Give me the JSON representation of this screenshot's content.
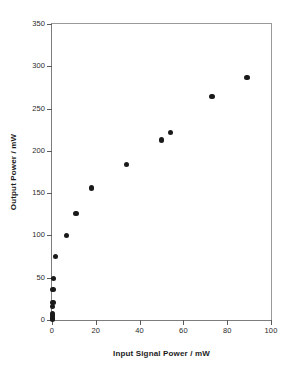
{
  "chart_data": {
    "type": "scatter",
    "title": "",
    "xlabel": "Input Signal Power / mW",
    "ylabel": "Output Power / mW",
    "xlim": [
      0,
      100
    ],
    "ylim": [
      0,
      350
    ],
    "xticks": [
      0,
      20,
      40,
      60,
      80,
      100
    ],
    "yticks": [
      0,
      50,
      100,
      150,
      200,
      250,
      300,
      350
    ],
    "xtick_labels": [
      "0",
      "20",
      "40",
      "60",
      "80",
      "100"
    ],
    "ytick_labels": [
      "0",
      "50",
      "100",
      "150",
      "200",
      "250",
      "300",
      "350"
    ],
    "grid": false,
    "legend": null,
    "marker": "filled-circle",
    "marker_color": "#1a1a1a",
    "series": [
      {
        "name": "Output vs Input",
        "points": [
          {
            "x": 0.1,
            "y": 1
          },
          {
            "x": 0.15,
            "y": 3
          },
          {
            "x": 0.2,
            "y": 5
          },
          {
            "x": 0.25,
            "y": 8
          },
          {
            "x": 0.3,
            "y": 16
          },
          {
            "x": 0.4,
            "y": 21
          },
          {
            "x": 0.5,
            "y": 36
          },
          {
            "x": 0.6,
            "y": 49
          },
          {
            "x": 1.6,
            "y": 75
          },
          {
            "x": 6.5,
            "y": 100
          },
          {
            "x": 11,
            "y": 126
          },
          {
            "x": 18,
            "y": 156
          },
          {
            "x": 34,
            "y": 184
          },
          {
            "x": 50,
            "y": 213
          },
          {
            "x": 54,
            "y": 222
          },
          {
            "x": 73,
            "y": 264
          },
          {
            "x": 89,
            "y": 287
          }
        ]
      }
    ]
  },
  "axes": {
    "y_title": "Output Power / mW",
    "x_title": "Input Signal Power / mW"
  }
}
